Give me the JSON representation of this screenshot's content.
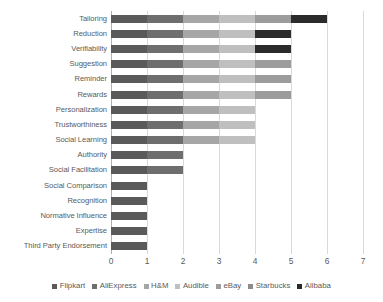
{
  "chart_data": {
    "type": "bar",
    "orientation": "horizontal",
    "stacked": true,
    "title": "",
    "xlabel": "",
    "ylabel": "",
    "xlim": [
      0,
      7
    ],
    "xticks": [
      "0",
      "1",
      "2",
      "3",
      "4",
      "5",
      "6",
      "7"
    ],
    "grid": "vertical",
    "legend_position": "bottom",
    "categories": [
      "Tailoring",
      "Reduction",
      "Verifiability",
      "Suggestion",
      "Reminder",
      "Rewards",
      "Personalization",
      "Trustworthiness",
      "Social Learning",
      "Authority",
      "Social Facilitation",
      "Social Comparison",
      "Recognition",
      "Normative Influence",
      "Expertise",
      "Third Party Endorsement"
    ],
    "series": [
      {
        "name": "Flipkart",
        "color": "#5a5a5a",
        "values": [
          1,
          1,
          1,
          1,
          1,
          1,
          1,
          1,
          1,
          1,
          1,
          1,
          1,
          1,
          1,
          1
        ]
      },
      {
        "name": "AliExpress",
        "color": "#6e6e6e",
        "values": [
          1,
          1,
          1,
          1,
          1,
          1,
          1,
          1,
          1,
          1,
          1,
          0,
          0,
          0,
          0,
          0
        ]
      },
      {
        "name": "H&M",
        "color": "#a6a6a6",
        "values": [
          1,
          1,
          1,
          1,
          1,
          1,
          1,
          1,
          1,
          0,
          0,
          0,
          0,
          0,
          0,
          0
        ]
      },
      {
        "name": "Audible",
        "color": "#bfbfbf",
        "values": [
          1,
          1,
          1,
          1,
          1,
          1,
          1,
          1,
          1,
          0,
          0,
          0,
          0,
          0,
          0,
          0
        ]
      },
      {
        "name": "eBay",
        "color": "#9c9c9c",
        "values": [
          1,
          0,
          0,
          1,
          1,
          1,
          0,
          0,
          0,
          0,
          0,
          0,
          0,
          0,
          0,
          0
        ]
      },
      {
        "name": "Starbucks",
        "color": "#8c8c8c",
        "values": [
          0,
          0,
          0,
          0,
          0,
          0,
          0,
          0,
          0,
          0,
          0,
          0,
          0,
          0,
          0,
          0
        ]
      },
      {
        "name": "Alibaba",
        "color": "#2b2b2b",
        "values": [
          1,
          1,
          1,
          0,
          0,
          0,
          0,
          0,
          0,
          0,
          0,
          0,
          0,
          0,
          0,
          0
        ]
      }
    ],
    "totals": [
      6,
      5,
      5,
      5,
      5,
      5,
      4,
      4,
      4,
      2,
      2,
      1,
      1,
      1,
      1,
      1
    ]
  },
  "colors": {
    "gridline": "#d9d9d9",
    "axis": "#b0b0b0",
    "text": "#5a5a5a",
    "background": "#ffffff"
  }
}
